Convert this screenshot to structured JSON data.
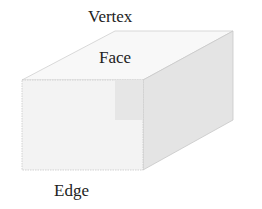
{
  "diagram": {
    "type": "labeled-3d-shape",
    "shape": "rectangular-prism",
    "labels": {
      "vertex": "Vertex",
      "face": "Face",
      "edge": "Edge"
    },
    "colors": {
      "front_face": "#f3f3f3",
      "top_face": "#f8f8f8",
      "side_face": "#e2e2e2",
      "edge_stroke": "#c8c8c8",
      "text": "#222222"
    }
  }
}
